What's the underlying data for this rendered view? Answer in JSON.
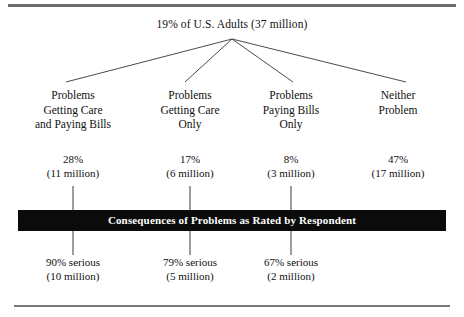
{
  "figure": {
    "root": {
      "label": "19% of U.S. Adults (37 million)"
    },
    "bar": {
      "label": "Consequences of Problems as Rated by Respondent",
      "background": "#0b0b0b",
      "text_color": "#ffffff"
    },
    "branches": [
      {
        "center_x": 73,
        "heading_lines": [
          "Problems",
          "Getting Care",
          "and Paying Bills"
        ],
        "percent": "28%",
        "count": "(11 million)",
        "has_tick": true,
        "serious_percent": "90% serious",
        "serious_count": "(10 million)"
      },
      {
        "center_x": 190,
        "heading_lines": [
          "Problems",
          "Getting Care",
          "Only"
        ],
        "percent": "17%",
        "count": "(6 million)",
        "has_tick": true,
        "serious_percent": "79% serious",
        "serious_count": "(5 million)"
      },
      {
        "center_x": 291,
        "heading_lines": [
          "Problems",
          "Paying Bills",
          "Only"
        ],
        "percent": "8%",
        "count": "(3 million)",
        "has_tick": true,
        "serious_percent": "67% serious",
        "serious_count": "(2 million)"
      },
      {
        "center_x": 398,
        "heading_lines": [
          "Neither",
          "Problem"
        ],
        "percent": "47%",
        "count": "(17 million)",
        "has_tick": false,
        "serious_percent": "",
        "serious_count": ""
      }
    ],
    "connector": {
      "apex_x": 232,
      "apex_y": 39,
      "endpoints_y": 82,
      "endpoints_x": [
        66,
        185,
        293,
        406
      ],
      "color": "#4a4a4a"
    },
    "rules": {
      "top_color": "#6d6d6d",
      "bottom_color": "#7a7a7a"
    }
  }
}
